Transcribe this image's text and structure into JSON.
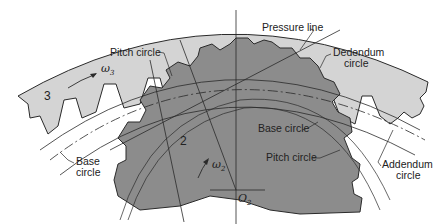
{
  "figure": {
    "type": "gear mesh geometry diagram",
    "colors": {
      "background": "#ffffff",
      "gear3_fill": "#d4d4d4",
      "gear2_fill": "#8c8c8c",
      "line": "#2a2a2a"
    }
  },
  "labels": {
    "pressure_line": "Pressure line",
    "pitch_circle_top": "Pitch circle",
    "dedendum_line1": "Dedendum",
    "dedendum_line2": "circle",
    "base_circle_left_line1": "Base",
    "base_circle_left_line2": "circle",
    "base_circle_right": "Base circle",
    "pitch_circle_right": "Pitch circle",
    "addendum_line1": "Addendum",
    "addendum_line2": "circle",
    "gear3_number": "3",
    "gear2_number": "2",
    "omega3": "ω",
    "omega3_sub": "3",
    "omega2": "ω",
    "omega2_sub": "2",
    "center": "O",
    "center_sub": "2"
  }
}
